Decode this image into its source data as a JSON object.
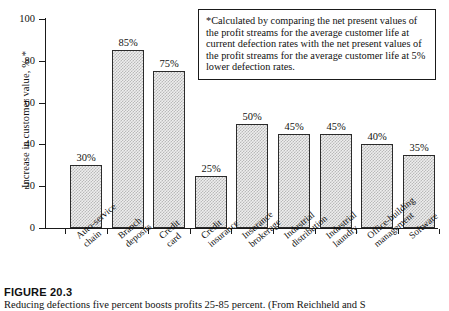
{
  "chart_data": {
    "type": "bar",
    "title": "",
    "categories": [
      "Auto-service\nchain",
      "Branch\ndeposits",
      "Credit\ncard",
      "Credit\ninsurance",
      "Insurance\nbrokerage",
      "Industrial\ndistribution",
      "Industrial\nlaundry",
      "Office-building\nmanagement",
      "Software"
    ],
    "values": [
      30,
      85,
      75,
      25,
      50,
      45,
      45,
      40,
      35
    ],
    "data_labels": [
      "30%",
      "85%",
      "75%",
      "25%",
      "50%",
      "45%",
      "45%",
      "40%",
      "35%"
    ],
    "xlabel": "",
    "ylabel": "Increase in customer value, % *",
    "ylim": [
      0,
      100
    ],
    "ytick_labels": [
      "0",
      "20",
      "40",
      "60",
      "80",
      "100"
    ],
    "ytick_values": [
      0,
      20,
      40,
      60,
      80,
      100
    ],
    "grid": false,
    "legend": null,
    "bar_fill_color": "#eeeeee",
    "bar_edge_color": "#2b2b2b",
    "axis_color": "#1a1a1a"
  },
  "note": {
    "text": "*Calculated by comparing the net present values of the profit streams for the average customer life at current defection rates with the net present values of the profit streams for the average customer life at 5% lower defection rates."
  },
  "caption": {
    "figure_number": "FIGURE 20.3",
    "text": "Reducing defections five percent boosts profits 25-85 percent. (From Reichheld and S"
  }
}
